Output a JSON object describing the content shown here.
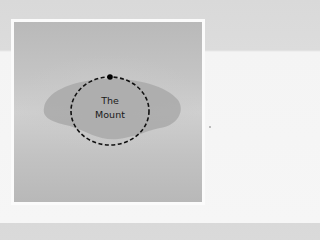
{
  "diagram": {
    "label_line1": "The",
    "label_line2": "Mount",
    "colors": {
      "background_top": "#dcdcdc",
      "background_bottom": "#f6f6f6",
      "frame": "#fbfbfb",
      "field": "#c4c4c4",
      "region": "#a9a9a9",
      "dashed_boundary": "#111111",
      "point": "#000000"
    }
  }
}
